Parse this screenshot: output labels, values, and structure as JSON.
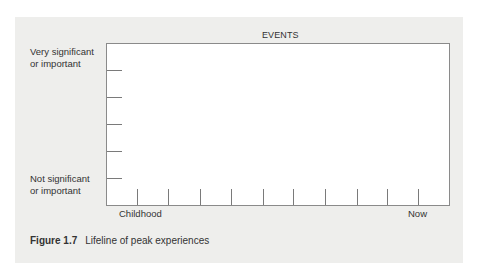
{
  "figure": {
    "number": "Figure 1.7",
    "title": "Lifeline of peak experiences"
  },
  "chart_data": {
    "type": "line",
    "title": "EVENTS",
    "xlabel": "",
    "ylabel": "",
    "x_tick_labels": [
      "Childhood",
      "Now"
    ],
    "x_tick_count": 10,
    "y_tick_count": 5,
    "y_labels": {
      "top": "Very significant or important",
      "bottom": "Not significant or important"
    },
    "series": [],
    "grid": false,
    "note": "Blank template chart for plotting a personal lifeline of peak experiences"
  },
  "labels": {
    "events": "EVENTS",
    "y_top_line1": "Very significant",
    "y_top_line2": "or important",
    "y_bottom_line1": "Not significant",
    "y_bottom_line2": "or important",
    "x_start": "Childhood",
    "x_end": "Now"
  },
  "layout": {
    "y_ticks_px": [
      70,
      97,
      124,
      151,
      178
    ],
    "x_ticks_px": [
      137,
      168,
      200,
      231,
      263,
      293,
      325,
      357,
      387,
      418
    ]
  }
}
